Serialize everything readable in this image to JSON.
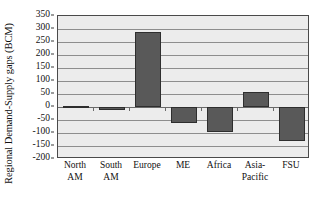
{
  "chart_data": {
    "type": "bar",
    "title": "",
    "xlabel": "",
    "ylabel": "Regional Demand-Supply gaps (BCM)",
    "categories": [
      "North AM",
      "South AM",
      "Europe",
      "ME",
      "Africa",
      "Asia-Pacific",
      "FSU"
    ],
    "category_lines": [
      [
        "North",
        "AM"
      ],
      [
        "South",
        "AM"
      ],
      [
        "Europe"
      ],
      [
        "ME"
      ],
      [
        "Africa"
      ],
      [
        "Asia-",
        "Pacific"
      ],
      [
        "FSU"
      ]
    ],
    "values": [
      0,
      -12,
      287,
      -60,
      -97,
      57,
      -130
    ],
    "ylim": [
      -200,
      350
    ],
    "ytick_step": 50,
    "yticks": [
      350,
      300,
      250,
      200,
      150,
      100,
      50,
      0,
      -50,
      -100,
      -150,
      -200
    ],
    "ytick_labels": [
      "350",
      "300",
      "250",
      "200",
      "150",
      "100",
      "50",
      "0",
      "-50",
      "-100",
      "-150",
      "-200"
    ],
    "grid": true,
    "legend": "none",
    "colors": {
      "bar_fill": "#595959",
      "bar_border": "#2e2e2e",
      "plot_background": "#ececec",
      "gridline": "#8e8e8e",
      "frame": "#4a4a4a",
      "text": "#111111",
      "page_background": "#ffffff"
    }
  }
}
